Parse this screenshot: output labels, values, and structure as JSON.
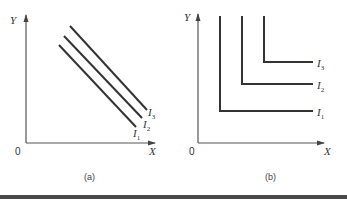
{
  "figure": {
    "panels": [
      {
        "caption": "(a)",
        "origin_label": "0",
        "x_axis_label": "X",
        "y_axis_label": "Y",
        "curve_type": "straight-line indifference curves (perfect substitutes)",
        "curves": [
          {
            "name": "I",
            "sub": "1"
          },
          {
            "name": "I",
            "sub": "2"
          },
          {
            "name": "I",
            "sub": "3"
          }
        ]
      },
      {
        "caption": "(b)",
        "origin_label": "0",
        "x_axis_label": "X",
        "y_axis_label": "Y",
        "curve_type": "L-shaped indifference curves (perfect complements)",
        "curves": [
          {
            "name": "I",
            "sub": "1"
          },
          {
            "name": "I",
            "sub": "2"
          },
          {
            "name": "I",
            "sub": "3"
          }
        ]
      }
    ],
    "colors": {
      "line": "#333333",
      "axis": "#555555",
      "bar": "#4a4a4a"
    }
  }
}
